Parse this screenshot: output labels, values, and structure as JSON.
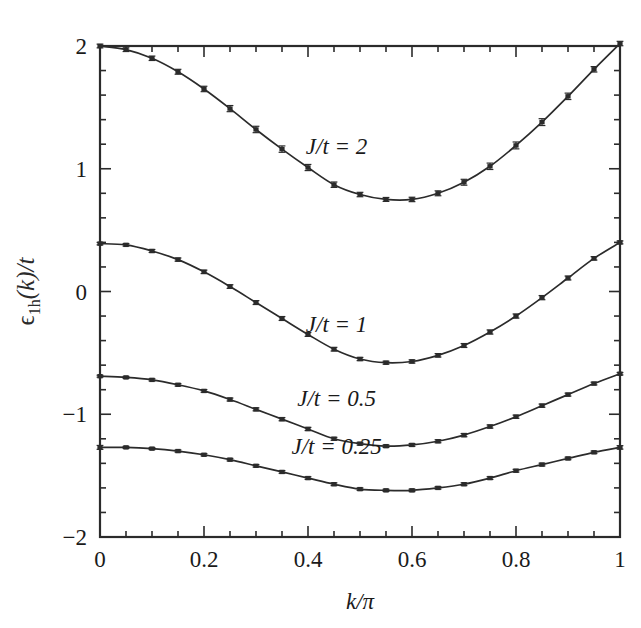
{
  "figure": {
    "background": "#ffffff",
    "ink_color": "#2b2b2b"
  },
  "chart_data": {
    "type": "line",
    "title": "",
    "subtitle": "",
    "xlabel": "k/π",
    "ylabel": "ϵ₁ₕ(k)/t",
    "ylabel_parts": {
      "symbol": "ϵ",
      "subscript": "1h",
      "argument": "(k)",
      "denominator": "/t"
    },
    "xlim": [
      0,
      1
    ],
    "ylim": [
      -2,
      2
    ],
    "grid": false,
    "legend_position": "inline-annotations",
    "xticks": [
      0,
      0.2,
      0.4,
      0.6,
      0.8,
      1
    ],
    "xtick_labels": [
      "0",
      "0.2",
      "0.4",
      "0.6",
      "0.8",
      "1"
    ],
    "xminor_step": 0.05,
    "yticks": [
      -2,
      -1,
      0,
      1,
      2
    ],
    "ytick_labels": [
      "−2",
      "−1",
      "0",
      "1",
      "2"
    ],
    "yminor_step": 0.2,
    "tick_direction": "in",
    "error_bars": true,
    "marker": "square",
    "x": [
      0,
      0.05,
      0.1,
      0.15,
      0.2,
      0.25,
      0.3,
      0.35,
      0.4,
      0.45,
      0.5,
      0.55,
      0.6,
      0.65,
      0.7,
      0.75,
      0.8,
      0.85,
      0.9,
      0.95,
      1
    ],
    "series": [
      {
        "name": "J/t = 2",
        "label": "J/t = 2",
        "label_x": 0.455,
        "label_y": 1.12,
        "values": [
          2.0,
          1.97,
          1.9,
          1.79,
          1.65,
          1.49,
          1.32,
          1.16,
          1.01,
          0.87,
          0.79,
          0.75,
          0.75,
          0.8,
          0.89,
          1.02,
          1.19,
          1.38,
          1.59,
          1.81,
          2.02
        ],
        "errors": [
          0.015,
          0.015,
          0.018,
          0.02,
          0.022,
          0.025,
          0.026,
          0.026,
          0.025,
          0.022,
          0.018,
          0.016,
          0.018,
          0.02,
          0.024,
          0.026,
          0.028,
          0.028,
          0.026,
          0.022,
          0.018
        ]
      },
      {
        "name": "J/t = 1",
        "label": "J/t = 1",
        "label_x": 0.455,
        "label_y": -0.33,
        "values": [
          0.39,
          0.38,
          0.33,
          0.26,
          0.16,
          0.04,
          -0.09,
          -0.22,
          -0.35,
          -0.47,
          -0.55,
          -0.58,
          -0.57,
          -0.52,
          -0.44,
          -0.33,
          -0.2,
          -0.05,
          0.11,
          0.27,
          0.4
        ],
        "errors": [
          0.01,
          0.01,
          0.012,
          0.013,
          0.014,
          0.015,
          0.016,
          0.016,
          0.016,
          0.015,
          0.013,
          0.012,
          0.013,
          0.014,
          0.016,
          0.017,
          0.017,
          0.017,
          0.016,
          0.014,
          0.012
        ]
      },
      {
        "name": "J/t = 0.5",
        "label": "J/t = 0.5",
        "label_x": 0.455,
        "label_y": -0.93,
        "values": [
          -0.69,
          -0.7,
          -0.72,
          -0.76,
          -0.81,
          -0.88,
          -0.96,
          -1.04,
          -1.12,
          -1.2,
          -1.24,
          -1.26,
          -1.25,
          -1.22,
          -1.17,
          -1.1,
          -1.02,
          -0.93,
          -0.84,
          -0.75,
          -0.67
        ],
        "errors": [
          0.008,
          0.008,
          0.009,
          0.01,
          0.011,
          0.012,
          0.012,
          0.013,
          0.013,
          0.012,
          0.011,
          0.01,
          0.011,
          0.012,
          0.013,
          0.013,
          0.013,
          0.013,
          0.012,
          0.011,
          0.01
        ]
      },
      {
        "name": "J/t = 0.25",
        "label": "J/t = 0.25",
        "label_x": 0.455,
        "label_y": -1.32,
        "values": [
          -1.27,
          -1.27,
          -1.28,
          -1.3,
          -1.33,
          -1.37,
          -1.42,
          -1.47,
          -1.52,
          -1.57,
          -1.61,
          -1.62,
          -1.62,
          -1.6,
          -1.57,
          -1.52,
          -1.46,
          -1.41,
          -1.36,
          -1.31,
          -1.27
        ],
        "errors": [
          0.016,
          0.008,
          0.008,
          0.009,
          0.009,
          0.01,
          0.01,
          0.011,
          0.011,
          0.011,
          0.01,
          0.009,
          0.01,
          0.01,
          0.011,
          0.011,
          0.011,
          0.011,
          0.01,
          0.01,
          0.014
        ]
      }
    ]
  }
}
